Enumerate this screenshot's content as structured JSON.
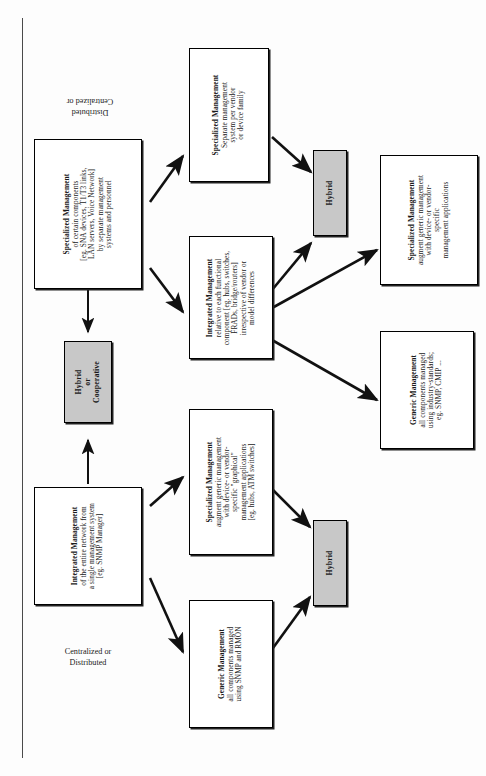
{
  "page": {
    "orientation": "rotated-90-ccw",
    "background": "#fdfdfd",
    "rule_color": "#4a4a4a"
  },
  "colors": {
    "box_fill": "#ffffff",
    "box_border": "#000000",
    "hybrid_fill": "#c8c8c8",
    "arrow": "#111111"
  },
  "captions": {
    "bottom": {
      "line1": "Centralized or",
      "line2": "Distributed"
    },
    "top": {
      "line1": "Centralized or",
      "line2": "Distributed"
    }
  },
  "nodes": {
    "spec_certain": {
      "title": "Specialized Management",
      "lines": [
        "of certain components",
        "[eg. SNA devices, T1/T3 links,",
        "LAN servers, Voice Network]",
        "by separate management",
        "systems and personnel"
      ]
    },
    "spec_per_vendor": {
      "title": "Specialized Management",
      "lines": [
        "Separate management",
        "system per vendor",
        "or device family"
      ]
    },
    "integrated_functional": {
      "title": "Integrated Management",
      "lines": [
        "relative to each functional",
        "component [eg. hubs, switches,",
        "FRADs, bridge/routers]",
        "irrespective of vendor or",
        "model differences"
      ]
    },
    "spec_augment_top": {
      "title": "Specialized Management",
      "lines": [
        "augment generic management",
        "with device- or vendor-",
        "specific",
        "management applications"
      ]
    },
    "generic_industry": {
      "title": "Generic Management",
      "lines": [
        "all components managed",
        "using industry-standards;",
        "eg. SNMP, CMIP ..."
      ]
    },
    "hybrid_top": {
      "title": "Hybrid",
      "lines": []
    },
    "hybrid_or_cooperative": {
      "title": "Hybrid",
      "lines": [
        "or",
        "Cooperative"
      ]
    },
    "integrated_entire": {
      "title": "Integrated Management",
      "lines": [
        "of the entire network from",
        "a single management system",
        "[eg. SNMP Manager]"
      ]
    },
    "spec_augment_bottom": {
      "title": "Specialized Management",
      "lines": [
        "augment generic management",
        "with device- or vendor-",
        "specific \"graphical\"",
        "management applications",
        "[eg. hubs, ATM switches]"
      ]
    },
    "generic_snmp_rmon": {
      "title": "Generic Management",
      "lines": [
        "all components managed",
        "using SNMP and RMON"
      ]
    },
    "hybrid_bottom": {
      "title": "Hybrid",
      "lines": []
    }
  },
  "edges": [
    {
      "from": "integrated_entire",
      "to": "spec_augment_bottom"
    },
    {
      "from": "integrated_entire",
      "to": "generic_snmp_rmon"
    },
    {
      "from": "integrated_entire",
      "to": "hybrid_or_cooperative"
    },
    {
      "from": "spec_augment_bottom",
      "to": "hybrid_bottom"
    },
    {
      "from": "generic_snmp_rmon",
      "to": "hybrid_bottom"
    },
    {
      "from": "spec_certain",
      "to": "spec_per_vendor"
    },
    {
      "from": "spec_certain",
      "to": "integrated_functional"
    },
    {
      "from": "spec_certain",
      "to": "hybrid_or_cooperative"
    },
    {
      "from": "spec_per_vendor",
      "to": "hybrid_top"
    },
    {
      "from": "integrated_functional",
      "to": "hybrid_top"
    },
    {
      "from": "integrated_functional",
      "to": "spec_augment_top"
    },
    {
      "from": "integrated_functional",
      "to": "generic_industry"
    }
  ]
}
